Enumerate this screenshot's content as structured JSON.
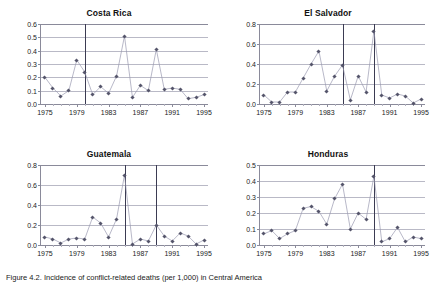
{
  "figure": {
    "caption": "Figure 4.2. Incidence of conflict-related deaths (per 1,000) in Central America"
  },
  "axis": {
    "xticks": [
      "1975",
      "1979",
      "1983",
      "1987",
      "1991",
      "1995"
    ],
    "xtick_values": [
      1975,
      1979,
      1983,
      1987,
      1991,
      1995
    ],
    "xlim": [
      1974.5,
      1995.5
    ]
  },
  "chart_data": [
    {
      "type": "line",
      "title": "Costa Rica",
      "xlabel": "",
      "ylabel": "",
      "xlim": [
        1974.5,
        1995.5
      ],
      "ylim": [
        0.0,
        0.6
      ],
      "grid": true,
      "legend": "none",
      "yticks": [
        0.0,
        0.1,
        0.2,
        0.3,
        0.4,
        0.5,
        0.6
      ],
      "ytick_labels": [
        "0.0",
        "0.1",
        "0.2",
        "0.3",
        "0.4",
        "0.5",
        "0.6"
      ],
      "x": [
        1975,
        1976,
        1977,
        1978,
        1979,
        1980,
        1981,
        1982,
        1983,
        1984,
        1985,
        1986,
        1987,
        1988,
        1989,
        1990,
        1991,
        1992,
        1993,
        1994,
        1995
      ],
      "values": [
        0.2,
        0.12,
        0.06,
        0.1,
        0.33,
        0.24,
        0.07,
        0.13,
        0.08,
        0.21,
        0.51,
        0.05,
        0.14,
        0.1,
        0.41,
        0.11,
        0.12,
        0.11,
        0.04,
        0.05,
        0.07
      ],
      "event_lines": [
        1980
      ],
      "marker": "diamond"
    },
    {
      "type": "line",
      "title": "El Salvador",
      "xlabel": "",
      "ylabel": "",
      "xlim": [
        1974.5,
        1995.5
      ],
      "ylim": [
        0.0,
        0.8
      ],
      "grid": true,
      "legend": "none",
      "yticks": [
        0.0,
        0.2,
        0.4,
        0.6,
        0.8
      ],
      "ytick_labels": [
        "0.0",
        "0.2",
        "0.4",
        "0.6",
        "0.8"
      ],
      "x": [
        1975,
        1976,
        1977,
        1978,
        1979,
        1980,
        1981,
        1982,
        1983,
        1984,
        1985,
        1986,
        1987,
        1988,
        1989,
        1990,
        1991,
        1992,
        1993,
        1994,
        1995
      ],
      "values": [
        0.09,
        0.02,
        0.02,
        0.12,
        0.12,
        0.26,
        0.4,
        0.53,
        0.13,
        0.28,
        0.39,
        0.04,
        0.28,
        0.12,
        0.73,
        0.09,
        0.06,
        0.1,
        0.08,
        0.01,
        0.05
      ],
      "event_lines": [
        1985,
        1989
      ],
      "marker": "diamond"
    },
    {
      "type": "line",
      "title": "Guatemala",
      "xlabel": "",
      "ylabel": "",
      "xlim": [
        1974.5,
        1995.5
      ],
      "ylim": [
        0.0,
        0.8
      ],
      "grid": true,
      "legend": "none",
      "yticks": [
        0.0,
        0.2,
        0.4,
        0.6,
        0.8
      ],
      "ytick_labels": [
        "0.0",
        "0.2",
        "0.4",
        "0.6",
        "0.8"
      ],
      "x": [
        1975,
        1976,
        1977,
        1978,
        1979,
        1980,
        1981,
        1982,
        1983,
        1984,
        1985,
        1986,
        1987,
        1988,
        1989,
        1990,
        1991,
        1992,
        1993,
        1994,
        1995
      ],
      "values": [
        0.08,
        0.06,
        0.02,
        0.06,
        0.07,
        0.06,
        0.28,
        0.22,
        0.08,
        0.26,
        0.7,
        0.01,
        0.06,
        0.04,
        0.2,
        0.09,
        0.04,
        0.12,
        0.09,
        0.01,
        0.05
      ],
      "event_lines": [
        1985,
        1989
      ],
      "marker": "diamond"
    },
    {
      "type": "line",
      "title": "Honduras",
      "xlabel": "",
      "ylabel": "",
      "xlim": [
        1974.5,
        1995.5
      ],
      "ylim": [
        0.0,
        0.5
      ],
      "grid": true,
      "legend": "none",
      "yticks": [
        0.0,
        0.1,
        0.2,
        0.3,
        0.4,
        0.5
      ],
      "ytick_labels": [
        "0.0",
        "0.1",
        "0.2",
        "0.3",
        "0.4",
        "0.5"
      ],
      "x": [
        1975,
        1976,
        1977,
        1978,
        1979,
        1980,
        1981,
        1982,
        1983,
        1984,
        1985,
        1986,
        1987,
        1988,
        1989,
        1990,
        1991,
        1992,
        1993,
        1994,
        1995
      ],
      "values": [
        0.07,
        0.09,
        0.04,
        0.07,
        0.09,
        0.23,
        0.24,
        0.21,
        0.13,
        0.29,
        0.38,
        0.1,
        0.2,
        0.16,
        0.43,
        0.02,
        0.04,
        0.11,
        0.02,
        0.05,
        0.04
      ],
      "event_lines": [
        1989
      ],
      "marker": "diamond"
    }
  ]
}
